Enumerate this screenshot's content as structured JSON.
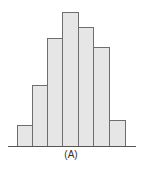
{
  "chart_data": {
    "type": "bar",
    "title": "",
    "xlabel": "(A)",
    "ylabel": "",
    "categories": [
      "1",
      "2",
      "3",
      "4",
      "5",
      "6",
      "7"
    ],
    "values": [
      21,
      61,
      108,
      134,
      119,
      99,
      26
    ],
    "grid": false,
    "legend": null,
    "bar_fill": "#e6e6e6",
    "bar_edge": "#6e6e6e",
    "layout": {
      "axis_y": 146,
      "axis_x_start": 8,
      "axis_x_end": 136,
      "bars_px": [
        {
          "x": 17,
          "w": 15,
          "h": 21
        },
        {
          "x": 32,
          "w": 15,
          "h": 61
        },
        {
          "x": 47,
          "w": 15,
          "h": 108
        },
        {
          "x": 62,
          "w": 16,
          "h": 134
        },
        {
          "x": 78,
          "w": 15,
          "h": 119
        },
        {
          "x": 93,
          "w": 16,
          "h": 99
        },
        {
          "x": 109,
          "w": 16,
          "h": 26
        }
      ]
    }
  },
  "caption": "(A)"
}
